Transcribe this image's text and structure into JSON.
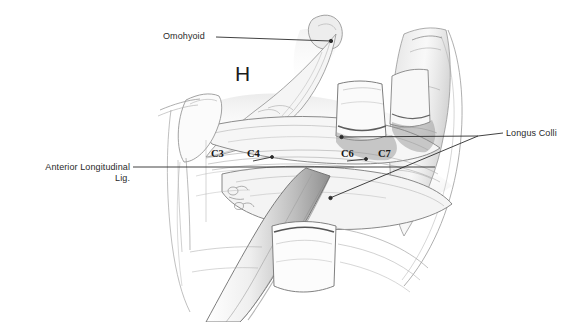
{
  "figure": {
    "kind": "anatomical-pencil-illustration",
    "background_color": "#ffffff",
    "ink_color": "#2a2a2a",
    "pencil_color": "#8d8d8d"
  },
  "labels": {
    "omohyoid": "Omohyoid",
    "longus_colli": "Longus Colli",
    "anterior_longitudinal_lig_line1": "Anterior Longitudinal",
    "anterior_longitudinal_lig_line2": "Lig.",
    "hyoid_marker": "H"
  },
  "vertebral_levels": [
    {
      "id": "c3",
      "label": "C3"
    },
    {
      "id": "c4",
      "label": "C4"
    },
    {
      "id": "c6",
      "label": "C6"
    },
    {
      "id": "c7",
      "label": "C7"
    }
  ]
}
